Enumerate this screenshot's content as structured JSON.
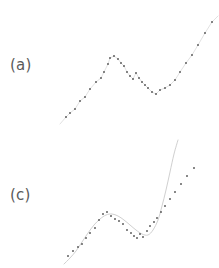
{
  "figure": {
    "background_color": "#ffffff",
    "marker_color": "#555555",
    "line_color": "#d9d9d9",
    "curve_color": "#d0d0d0",
    "label_color": "#5a5a5a"
  },
  "panels": [
    {
      "id": "a",
      "label": "(a)"
    },
    {
      "id": "c",
      "label": "(c)"
    }
  ],
  "chart_data": [
    {
      "type": "scatter",
      "title": "(a)",
      "xlabel": "",
      "ylabel": "",
      "xlim": [
        0,
        219
      ],
      "ylim": [
        134,
        0
      ],
      "grid": false,
      "legend": "none",
      "annotations": [
        "(a)"
      ],
      "series": [
        {
          "name": "observations",
          "marker": "dot",
          "x": [
            66,
            70,
            75,
            80,
            85,
            90,
            96,
            101,
            104,
            108,
            110,
            114,
            118,
            121,
            124,
            127,
            130,
            133,
            136,
            139,
            142,
            145,
            148,
            152,
            156,
            160,
            165,
            170,
            175,
            180,
            186,
            192,
            198,
            205,
            212
          ],
          "y": [
            117,
            113,
            109,
            101,
            97,
            89,
            82,
            78,
            72,
            64,
            58,
            56,
            59,
            63,
            66,
            72,
            76,
            79,
            73,
            78,
            82,
            85,
            88,
            92,
            94,
            90,
            88,
            85,
            80,
            72,
            63,
            55,
            45,
            33,
            22
          ]
        },
        {
          "name": "interpolating-line",
          "marker": "none",
          "x": [
            60,
            66,
            70,
            75,
            80,
            85,
            90,
            96,
            101,
            104,
            108,
            110,
            114,
            118,
            121,
            124,
            127,
            130,
            133,
            136,
            139,
            142,
            145,
            148,
            152,
            156,
            160,
            165,
            170,
            175,
            180,
            186,
            192,
            198,
            205,
            212,
            218
          ],
          "y": [
            124,
            117,
            113,
            109,
            101,
            97,
            89,
            82,
            78,
            72,
            64,
            58,
            56,
            59,
            63,
            66,
            72,
            76,
            79,
            73,
            78,
            82,
            85,
            88,
            92,
            94,
            90,
            88,
            85,
            80,
            72,
            63,
            55,
            45,
            33,
            22,
            16
          ]
        }
      ]
    },
    {
      "type": "scatter",
      "title": "(c)",
      "xlabel": "",
      "ylabel": "",
      "xlim": [
        0,
        219
      ],
      "ylim": [
        134,
        0
      ],
      "grid": false,
      "legend": "none",
      "annotations": [
        "(c)"
      ],
      "series": [
        {
          "name": "observations",
          "marker": "dot",
          "x": [
            68,
            73,
            78,
            82,
            86,
            90,
            95,
            99,
            103,
            107,
            111,
            115,
            119,
            123,
            127,
            131,
            134,
            137,
            140,
            143,
            147,
            150,
            154,
            157,
            161,
            165,
            170,
            175,
            181,
            187,
            194
          ],
          "y": [
            122,
            117,
            113,
            110,
            104,
            99,
            94,
            86,
            80,
            78,
            82,
            85,
            87,
            90,
            96,
            99,
            102,
            104,
            100,
            103,
            97,
            92,
            88,
            84,
            78,
            72,
            65,
            58,
            50,
            42,
            34
          ]
        },
        {
          "name": "smooth-fit",
          "marker": "none",
          "x": [
            64,
            70,
            76,
            82,
            88,
            94,
            100,
            106,
            112,
            118,
            124,
            130,
            136,
            142,
            148,
            153,
            158,
            162,
            166,
            170,
            174,
            178
          ],
          "y": [
            130,
            124,
            117,
            108,
            99,
            91,
            85,
            81,
            80,
            82,
            86,
            91,
            96,
            100,
            101,
            96,
            86,
            72,
            56,
            38,
            20,
            6
          ]
        }
      ]
    }
  ]
}
